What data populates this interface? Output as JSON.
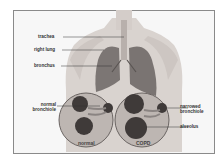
{
  "diagram": {
    "labels": {
      "trachea": "trachea",
      "right_lung": "right lung",
      "bronchus": "bronchus",
      "normal_bronchiole_1": "normal",
      "normal_bronchiole_2": "bronchiole",
      "narrowed_bronchiole_1": "narrowed",
      "narrowed_bronchiole_2": "bronchiole",
      "alveolus": "alveolus"
    },
    "captions": {
      "normal": "normal",
      "copd": "COPD"
    },
    "colors": {
      "skin": "#d9d3cf",
      "lung": "#7c7674",
      "alveoli": "#3f3a39",
      "circle_bg": "#bdb6b2",
      "border": "#8a8a8a"
    }
  }
}
